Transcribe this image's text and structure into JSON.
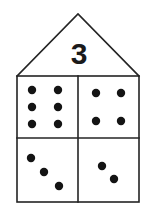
{
  "figure": {
    "type": "house-diagram",
    "background_color": "#ffffff",
    "line_color": "#242424",
    "dot_color": "#141414"
  },
  "roof": {
    "label": "3",
    "apex": {
      "x": 78,
      "y": 14
    },
    "left_corner": {
      "x": 17,
      "y": 76
    },
    "right_corner": {
      "x": 139,
      "y": 76
    },
    "label_position": {
      "x": 79,
      "y": 56
    }
  },
  "body": {
    "left": 17,
    "top": 76,
    "right": 139,
    "bottom": 202,
    "vertical_divider_x": 78,
    "horizontal_divider_y": 138
  },
  "quadrants": [
    {
      "name": "top-left",
      "dot_count": 6,
      "arrangement": "2 columns by 3 rows",
      "dot_radius": 4.2,
      "dots": [
        {
          "x": 32,
          "y": 90
        },
        {
          "x": 58,
          "y": 90
        },
        {
          "x": 32,
          "y": 107
        },
        {
          "x": 58,
          "y": 107
        },
        {
          "x": 32,
          "y": 124
        },
        {
          "x": 58,
          "y": 124
        }
      ]
    },
    {
      "name": "top-right",
      "dot_count": 4,
      "arrangement": "2 columns by 2 rows",
      "dot_radius": 4.2,
      "dots": [
        {
          "x": 96,
          "y": 93
        },
        {
          "x": 121,
          "y": 93
        },
        {
          "x": 96,
          "y": 121
        },
        {
          "x": 121,
          "y": 121
        }
      ]
    },
    {
      "name": "bottom-left",
      "dot_count": 3,
      "arrangement": "diagonal",
      "dot_radius": 4.2,
      "dots": [
        {
          "x": 31,
          "y": 158
        },
        {
          "x": 44,
          "y": 172
        },
        {
          "x": 59,
          "y": 186
        }
      ]
    },
    {
      "name": "bottom-right",
      "dot_count": 2,
      "arrangement": "diagonal",
      "dot_radius": 4.2,
      "dots": [
        {
          "x": 102,
          "y": 166
        },
        {
          "x": 114,
          "y": 179
        }
      ]
    }
  ],
  "totals": {
    "all_dots": 15
  }
}
